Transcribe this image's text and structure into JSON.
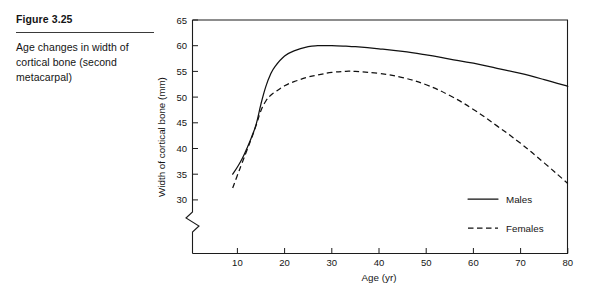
{
  "caption": {
    "figure_number": "Figure 3.25",
    "text": "Age changes in width of cortical bone (second metacarpal)"
  },
  "chart_data": {
    "type": "line",
    "title": "",
    "subtitle": "",
    "xlabel": "Age (yr)",
    "ylabel": "Width of cortical bone (mm)",
    "xlim": [
      5,
      80
    ],
    "ylim": [
      28,
      65
    ],
    "xticks": [
      10,
      20,
      30,
      40,
      50,
      60,
      70,
      80
    ],
    "xtick_labels": [
      "10",
      "20",
      "30",
      "40",
      "50",
      "60",
      "70",
      "80"
    ],
    "yticks": [
      30,
      35,
      40,
      45,
      50,
      55,
      60,
      65
    ],
    "ytick_labels": [
      "30",
      "35",
      "40",
      "45",
      "50",
      "55",
      "60",
      "65"
    ],
    "grid": false,
    "y_axis_break": true,
    "legend_position": "bottom-right",
    "series": [
      {
        "name": "Males",
        "style": "solid",
        "x": [
          9,
          10,
          11,
          12,
          13,
          14,
          15,
          16,
          17,
          18,
          20,
          22,
          25,
          27,
          30,
          33,
          35,
          40,
          45,
          50,
          55,
          60,
          65,
          70,
          75,
          80
        ],
        "values": [
          35.0,
          36.4,
          38.0,
          40.0,
          42.2,
          44.8,
          48.7,
          52.0,
          54.4,
          56.0,
          58.0,
          59.0,
          59.8,
          60.0,
          60.0,
          59.9,
          59.8,
          59.4,
          58.9,
          58.2,
          57.4,
          56.6,
          55.6,
          54.6,
          53.4,
          52.1
        ]
      },
      {
        "name": "Females",
        "style": "dashed",
        "x": [
          9,
          10,
          11,
          12,
          13,
          14,
          15,
          16,
          17,
          18,
          20,
          22,
          25,
          27,
          30,
          33,
          35,
          40,
          45,
          50,
          55,
          60,
          65,
          70,
          75,
          80
        ],
        "values": [
          32.3,
          34.8,
          37.2,
          39.6,
          42.0,
          44.6,
          47.4,
          49.2,
          50.3,
          51.0,
          52.2,
          53.0,
          53.9,
          54.3,
          54.8,
          55.0,
          55.0,
          54.6,
          53.8,
          52.4,
          50.3,
          47.6,
          44.4,
          41.0,
          37.2,
          33.2
        ]
      }
    ],
    "legend": [
      {
        "label": "Males",
        "style": "solid"
      },
      {
        "label": "Females",
        "style": "dashed"
      }
    ]
  }
}
